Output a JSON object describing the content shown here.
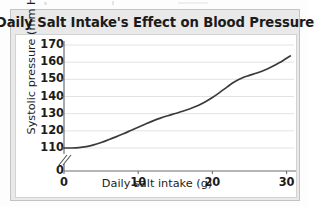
{
  "chart_data": {
    "type": "line",
    "title": "Daily Salt Intake's Effect on Blood Pressure",
    "xlabel": "Daily salt intake (g)",
    "ylabel": "Systolic pressure (mm Hg)",
    "xlim": [
      0,
      31
    ],
    "ylim": [
      105,
      173
    ],
    "xticks": [
      0,
      10,
      20,
      30
    ],
    "xtick_labels": [
      "0",
      "10",
      "20",
      "30"
    ],
    "yticks": [
      110,
      120,
      130,
      140,
      150,
      160,
      170
    ],
    "ytick_labels": [
      "110",
      "120",
      "130",
      "140",
      "150",
      "160",
      "170"
    ],
    "y_origin_label": "0",
    "axis_break": true,
    "grid": true,
    "grid_axis": "y",
    "legend": null,
    "series": [
      {
        "name": "Systolic pressure",
        "x": [
          0,
          1,
          2,
          3,
          4,
          5,
          6,
          7,
          8,
          9,
          10,
          11,
          12,
          13,
          14,
          15,
          16,
          17,
          18,
          19,
          20,
          21,
          22,
          23,
          24,
          25,
          26,
          27,
          28,
          29,
          30,
          30.5
        ],
        "values": [
          110,
          110,
          110.2,
          110.8,
          111.8,
          113.2,
          114.8,
          116.5,
          118.3,
          120.2,
          122.1,
          124.0,
          125.8,
          127.4,
          128.8,
          130.1,
          131.4,
          132.9,
          134.6,
          136.8,
          139.4,
          142.4,
          145.6,
          148.6,
          150.8,
          152.3,
          153.7,
          155.3,
          157.3,
          159.6,
          162.3,
          163.6
        ]
      }
    ],
    "line_color": "#3b3b3b",
    "grid_color": "#e2e2e2",
    "axis_color": "#6f6f6f",
    "plot_background": "#ffffff",
    "panel_background": "#e9e9e9"
  }
}
